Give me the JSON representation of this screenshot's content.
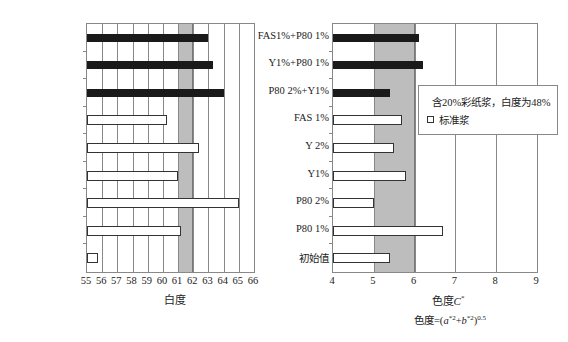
{
  "chart_data": [
    {
      "type": "bar",
      "orientation": "horizontal",
      "title": "",
      "xlabel": "白度",
      "ylabel": "",
      "xlim": [
        55,
        66
      ],
      "xticks": [
        55,
        56,
        57,
        58,
        59,
        60,
        61,
        62,
        63,
        64,
        65,
        66
      ],
      "grid": true,
      "highlight_band": [
        61,
        62
      ],
      "categories": [
        "FAS1%+P80 1%",
        "Y1%+P80 1%",
        "P80 2%+Y1%",
        "FAS 1%",
        "Y 2%",
        "Y1%",
        "P80 2%",
        "P80 1%",
        "初始值"
      ],
      "series_by_category": [
        "含20%彩纸浆，白度为48%",
        "含20%彩纸浆，白度为48%",
        "含20%彩纸浆，白度为48%",
        "标准浆",
        "标准浆",
        "标准浆",
        "标准浆",
        "标准浆",
        "标准浆"
      ],
      "values": [
        63.0,
        63.3,
        64.0,
        60.3,
        62.4,
        61.0,
        65.0,
        61.2,
        55.7
      ]
    },
    {
      "type": "bar",
      "orientation": "horizontal",
      "title": "",
      "xlabel": "色度C*",
      "formula": "色度=(a*2+b*2)0.5",
      "ylabel": "",
      "xlim": [
        4,
        9
      ],
      "xticks": [
        4,
        5,
        6,
        7,
        8,
        9
      ],
      "grid": true,
      "highlight_band": [
        5,
        6
      ],
      "legend_position": "upper right inside",
      "categories": [
        "FAS1%+P80 1%",
        "Y1%+P80 1%",
        "P80 2%+Y1%",
        "FAS 1%",
        "Y 2%",
        "Y1%",
        "P80 2%",
        "P80 1%",
        "初始值"
      ],
      "series_by_category": [
        "含20%彩纸浆，白度为48%",
        "含20%彩纸浆，白度为48%",
        "含20%彩纸浆，白度为48%",
        "标准浆",
        "标准浆",
        "标准浆",
        "标准浆",
        "标准浆",
        "标准浆"
      ],
      "values": [
        6.1,
        6.2,
        5.4,
        5.7,
        5.5,
        5.8,
        5.0,
        6.7,
        5.4
      ]
    }
  ],
  "legend": {
    "items": [
      {
        "label": "含20%彩纸浆，白度为48%",
        "style": "dark"
      },
      {
        "label": "标准浆",
        "style": "light"
      }
    ]
  },
  "left": {
    "xlabel": "白度",
    "ticks": [
      "55",
      "56",
      "57",
      "58",
      "59",
      "60",
      "61",
      "62",
      "63",
      "64",
      "65",
      "66"
    ]
  },
  "right": {
    "xlabel_main": "色度",
    "xlabel_var": "C",
    "xlabel_sup": "*",
    "formula_prefix": "色度=(",
    "formula_a": "a",
    "formula_a_sup": "*2",
    "formula_plus": "+",
    "formula_b": "b",
    "formula_b_sup": "*2",
    "formula_close": ")",
    "formula_exp": "0.5",
    "ticks": [
      "4",
      "5",
      "6",
      "7",
      "8",
      "9"
    ]
  },
  "categories": [
    "FAS1%+P80 1%",
    "Y1%+P80 1%",
    "P80 2%+Y1%",
    "FAS 1%",
    "Y 2%",
    "Y1%",
    "P80 2%",
    "P80 1%",
    "初始值"
  ],
  "colors": {
    "dark_bar": "#1a1a1a",
    "band": "#bdbdbd",
    "grid": "#888888"
  }
}
